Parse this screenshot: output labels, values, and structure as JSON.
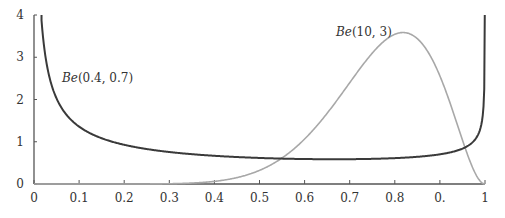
{
  "chart_data": {
    "type": "line",
    "title": "",
    "xlabel": "",
    "ylabel": "",
    "xlim": [
      0,
      1
    ],
    "ylim": [
      0,
      4
    ],
    "grid": false,
    "x_ticks": [
      0,
      0.1,
      0.2,
      0.3,
      0.4,
      0.5,
      0.6,
      0.7,
      0.8,
      0.9,
      1
    ],
    "x_tick_labels": [
      "0",
      "0.1",
      "0.2",
      "0.3",
      "0.4",
      "0.5",
      "0.6",
      "0.7",
      "0.8",
      "0.",
      "1"
    ],
    "y_ticks": [
      0,
      1,
      2,
      3,
      4
    ],
    "y_tick_labels": [
      "0",
      "1",
      "2",
      "3",
      "4"
    ],
    "series": [
      {
        "name": "Be(0.4, 0.7)",
        "label_prefix": "Be",
        "label_args": "(0.4, 0.7)",
        "alpha": 0.4,
        "beta": 0.7,
        "color": "#3a3a3a",
        "x": [
          0.02,
          0.05,
          0.1,
          0.2,
          0.3,
          0.4,
          0.5,
          0.6,
          0.7,
          0.8,
          0.9,
          0.95,
          0.99
        ],
        "values": [
          3.44,
          2.13,
          1.45,
          0.97,
          0.79,
          0.7,
          0.66,
          0.65,
          0.68,
          0.76,
          0.98,
          1.26,
          2.05
        ]
      },
      {
        "name": "Be(10, 3)",
        "label_prefix": "Be",
        "label_args": "(10, 3)",
        "alpha": 10,
        "beta": 3,
        "color": "#a8a8a8",
        "x": [
          0.3,
          0.4,
          0.5,
          0.6,
          0.7,
          0.8,
          0.818,
          0.9,
          0.95,
          1.0
        ],
        "values": [
          0.06,
          0.36,
          0.32,
          1.07,
          2.2,
          3.54,
          3.58,
          2.56,
          1.04,
          0.0
        ]
      }
    ]
  }
}
